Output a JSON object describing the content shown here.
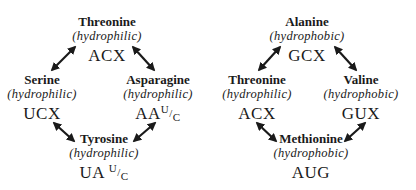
{
  "diagrams": [
    {
      "nodes": [
        {
          "name": "Threonine",
          "property": "(hydrophilic)",
          "codon": "ACX",
          "codon_wobble": null
        },
        {
          "name": "Serine",
          "property": "(hydrophilic)",
          "codon": "UCX",
          "codon_wobble": null
        },
        {
          "name": "Asparagine",
          "property": "(hydrophilic)",
          "codon": "AA",
          "codon_wobble": {
            "top": "U",
            "slash": "/",
            "bottom": "C"
          }
        },
        {
          "name": "Tyrosine",
          "property": "(hydrophilic)",
          "codon": "UA",
          "codon_wobble": {
            "top": "U",
            "slash": "/",
            "bottom": "C"
          }
        }
      ],
      "edges": [
        [
          "Threonine",
          "Serine"
        ],
        [
          "Threonine",
          "Asparagine"
        ],
        [
          "Serine",
          "Tyrosine"
        ],
        [
          "Asparagine",
          "Tyrosine"
        ]
      ]
    },
    {
      "nodes": [
        {
          "name": "Alanine",
          "property": "(hydrophobic)",
          "codon": "GCX"
        },
        {
          "name": "Threonine",
          "property": "(hydrophilic)",
          "codon": "ACX"
        },
        {
          "name": "Valine",
          "property": "(hydrophobic)",
          "codon": "GUX"
        },
        {
          "name": "Methionine",
          "property": "(hydrophobic)",
          "codon": "AUG"
        }
      ],
      "edges": [
        [
          "Alanine",
          "Threonine"
        ],
        [
          "Alanine",
          "Valine"
        ],
        [
          "Threonine",
          "Methionine"
        ],
        [
          "Valine",
          "Methionine"
        ]
      ]
    }
  ],
  "colors": {
    "text": "#1a1a1a",
    "arrow": "#1a1a1a",
    "background": "#ffffff"
  }
}
